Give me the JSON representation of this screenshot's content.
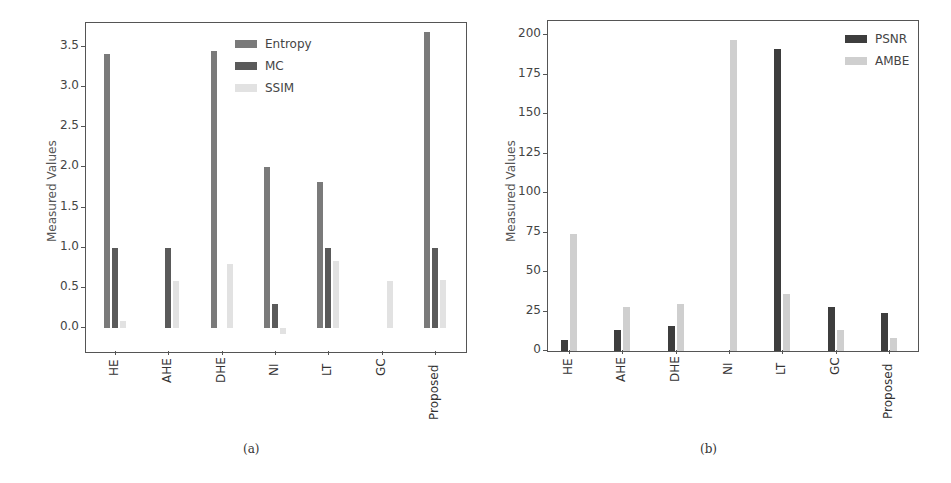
{
  "chart_data": [
    {
      "type": "bar",
      "panel": "(a)",
      "title": "",
      "xlabel": "",
      "ylabel": "Measured Values",
      "categories": [
        "HE",
        "AHE",
        "DHE",
        "NI",
        "LT",
        "GC",
        "Proposed"
      ],
      "series": [
        {
          "name": "Entropy",
          "color": "#7a7a7a",
          "values": [
            3.41,
            0,
            3.45,
            2.0,
            1.82,
            0,
            3.69
          ]
        },
        {
          "name": "MC",
          "color": "#5a5a5a",
          "values": [
            0.99,
            0.99,
            0,
            0.3,
            1.0,
            0,
            0.99
          ]
        },
        {
          "name": "SSIM",
          "color": "#e2e2e2",
          "values": [
            0.09,
            0.58,
            0.8,
            -0.07,
            0.83,
            0.59,
            0.6
          ]
        }
      ],
      "yticks": [
        "0.0",
        "0.5",
        "1.0",
        "1.5",
        "2.0",
        "2.5",
        "3.0",
        "3.5"
      ],
      "ylim": [
        -0.3,
        3.8
      ],
      "grid": false,
      "legend_position": "upper center"
    },
    {
      "type": "bar",
      "panel": "(b)",
      "title": "",
      "xlabel": "",
      "ylabel": "Measured Values",
      "categories": [
        "HE",
        "AHE",
        "DHE",
        "NI",
        "LT",
        "GC",
        "Proposed"
      ],
      "series": [
        {
          "name": "PSNR",
          "color": "#3d3d3d",
          "values": [
            7,
            13,
            16,
            0,
            191,
            28,
            24
          ]
        },
        {
          "name": "AMBE",
          "color": "#cfcfcf",
          "values": [
            74,
            28,
            30,
            197,
            36,
            13,
            8
          ]
        }
      ],
      "yticks": [
        "0",
        "25",
        "50",
        "75",
        "100",
        "125",
        "150",
        "175",
        "200"
      ],
      "ylim": [
        0,
        209
      ],
      "grid": false,
      "legend_position": "upper right"
    }
  ],
  "panels": {
    "a": {
      "caption": "(a)",
      "ylabel": "Measured Values"
    },
    "b": {
      "caption": "(b)",
      "ylabel": "Measured Values"
    }
  }
}
